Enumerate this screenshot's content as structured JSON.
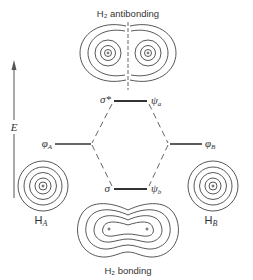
{
  "diagram": {
    "title_top": "H₂ antibonding",
    "title_bottom": "H₂ bonding",
    "axis_label": "E",
    "levels": {
      "antibonding": {
        "left_label": "σ*",
        "right_label": "ψ",
        "right_sub": "a"
      },
      "bonding": {
        "left_label": "σ",
        "right_label": "ψ",
        "right_sub": "b"
      },
      "atomic_a": {
        "label": "φ",
        "sub": "A"
      },
      "atomic_b": {
        "label": "φ",
        "sub": "B"
      }
    },
    "atoms": {
      "a": {
        "label": "H",
        "sub": "A"
      },
      "b": {
        "label": "H",
        "sub": "B"
      }
    },
    "colors": {
      "ink": "#333333",
      "background": "#ffffff"
    }
  }
}
